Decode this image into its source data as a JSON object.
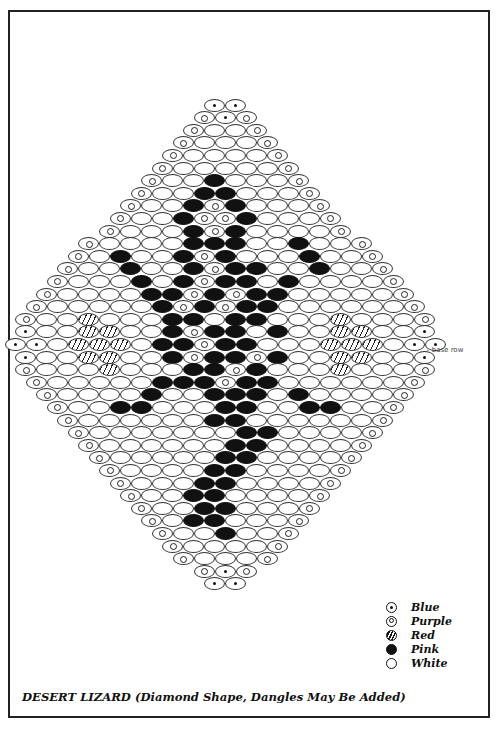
{
  "title": "DESERT LIZARD  (Diamond Shape, Dangles May Be Added)",
  "annotation": "– base row",
  "legend": [
    {
      "code": "B",
      "icon": "dot-bead-icon",
      "label": "Blue"
    },
    {
      "code": "P",
      "icon": "ring-bead-icon",
      "label": "Purple"
    },
    {
      "code": "R",
      "icon": "hatched-bead-icon",
      "label": "Red"
    },
    {
      "code": "K",
      "icon": "filled-bead-icon",
      "label": "Pink"
    },
    {
      "code": "W",
      "icon": "empty-bead-icon",
      "label": "White"
    }
  ],
  "pattern": {
    "center_x": 225,
    "top_y": 105,
    "row_spacing": 12.6,
    "bead_width": 21,
    "base_row_index": 19,
    "rows": [
      "BB",
      "PBP",
      "PWWP",
      "PWWWP",
      "PWWWWP",
      "PWWWWWP",
      "PWWKWWWP",
      "PWWKKWWWP",
      "PWWKPKWWWP",
      "PWWKPPKWWWP",
      "PWWWKPKWWWWP",
      "PWWWWKKKWWKWWP",
      "PWKWWKPKWWWKWWP",
      "PWWKWWKPKKWWKWWP",
      "PWWWKWKPKKWKWWWWP",
      "PWWWWKKPKPKKWWWWWP",
      "PWWWWWKPKPKKWWWWWWP",
      "PWWRWWWKKWKKWWWRWWWP",
      "BWWRRWWKPKKWKWWRRWWB",
      "BBWRRRWKKPKKWWWRRRWBB",
      "BWWRRWWKPKKPKWWRRWWB",
      "PWWWRWWWKKPKWWWRWWWP",
      "PWWWWWKKKPKKWWWWWWP",
      "PWWWWKWWKKKWKWWWWP",
      "PWWKKWWWKKWWKKWWP",
      "PWWWWWWKKWWWWWWP",
      "PWWWWWWWKKWWWWP",
      "PWWWWWWKKWWWWP",
      "PWWWWWKKWWWWP",
      "PWWWWKKWWWWP",
      "PWWWKKWWWWP",
      "PWWKKWWWWP",
      "PWWKKWWWP",
      "PWKKWWWP",
      "PWWKWWP",
      "PWWWWP",
      "PWWWP",
      "PBP",
      "BB"
    ]
  }
}
